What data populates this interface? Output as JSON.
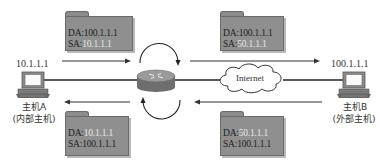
{
  "diagram": {
    "hosts": {
      "a": {
        "ip": "10.1.1.1",
        "name": "主机A",
        "role": "(内部主机)"
      },
      "b": {
        "ip": "100.1.1.1",
        "name": "主机B",
        "role": "(外部主机)"
      }
    },
    "cloud": {
      "label": "Internet"
    },
    "packets": {
      "top_left": {
        "da_label": "DA:",
        "da": "100.1.1.1",
        "sa_label": "SA:",
        "sa": "10.1.1.1"
      },
      "top_right": {
        "da_label": "DA:",
        "da": "100.1.1.1",
        "sa_label": "SA:",
        "sa": "50.1.1.1"
      },
      "bottom_left": {
        "da_label": "DA:",
        "da": "10.1.1.1",
        "sa_label": "SA:",
        "sa": "100.1.1.1"
      },
      "bottom_right": {
        "da_label": "DA:",
        "da": "50.1.1.1",
        "sa_label": "SA:",
        "sa": "100.1.1.1"
      }
    },
    "colors": {
      "folder_fill": "#8f8f8f",
      "highlight_text": "#e6e6e6",
      "line": "#222222",
      "router": "#7a7a7a"
    },
    "icons": [
      "router-icon",
      "cloud-icon",
      "computer-icon",
      "folder-icon",
      "arrow-icon",
      "rotate-arrow-icon"
    ]
  }
}
